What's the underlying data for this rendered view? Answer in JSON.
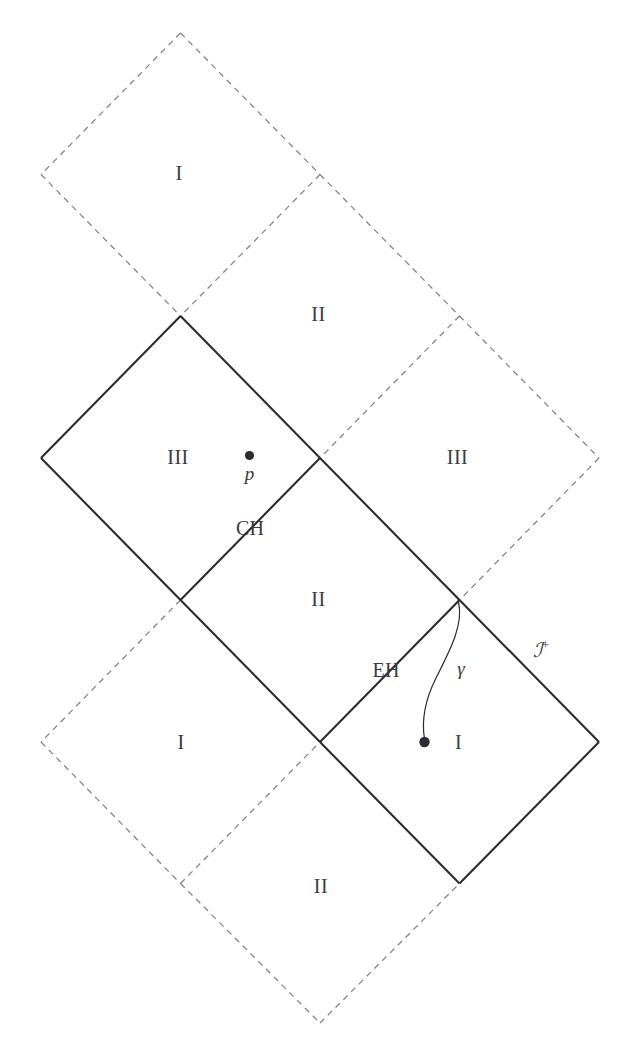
{
  "figure": {
    "kind": "penrose-conformal-diagram",
    "width": 635,
    "height": 1059,
    "background_color": "#ffffff",
    "solid_line_color": "#2b2b31",
    "dashed_line_color": "#85858c",
    "text_color": "#3a3a40",
    "solid_line_width": 2.1,
    "dashed_line_width": 1.3,
    "dash_pattern": "6 5"
  },
  "lattice": {
    "x_nodes": [
      41,
      180.5,
      320,
      459.5,
      599
    ],
    "y_nodes": [
      33,
      174.5,
      316,
      458,
      600,
      742,
      883.5,
      1023
    ],
    "x_spacing": 139.5,
    "y_spacing": 141.5
  },
  "edges": {
    "solid": [
      {
        "name": "ch-left-upper",
        "x1": 180.5,
        "y1": 316,
        "x2": 41,
        "y2": 458
      },
      {
        "name": "ch-right-upper",
        "x1": 180.5,
        "y1": 316,
        "x2": 320,
        "y2": 458
      },
      {
        "name": "iii-left-lower-left",
        "x1": 41,
        "y1": 458,
        "x2": 180.5,
        "y2": 600
      },
      {
        "name": "cauchy-horizon-CH",
        "x1": 320,
        "y1": 458,
        "x2": 180.5,
        "y2": 600
      },
      {
        "name": "ii-right-upper",
        "x1": 320,
        "y1": 458,
        "x2": 459.5,
        "y2": 600
      },
      {
        "name": "event-horizon-EH",
        "x1": 459.5,
        "y1": 600,
        "x2": 320,
        "y2": 742
      },
      {
        "name": "scri-plus-edge",
        "x1": 459.5,
        "y1": 600,
        "x2": 599,
        "y2": 742
      },
      {
        "name": "ii-lower-left",
        "x1": 180.5,
        "y1": 600,
        "x2": 320,
        "y2": 742
      },
      {
        "name": "region-i-lower-left",
        "x1": 320,
        "y1": 742,
        "x2": 459.5,
        "y2": 883.5
      },
      {
        "name": "region-i-lower-right",
        "x1": 599,
        "y1": 742,
        "x2": 459.5,
        "y2": 883.5
      }
    ],
    "dashed": [
      {
        "name": "top-i-upper-left",
        "x1": 180.5,
        "y1": 33,
        "x2": 41,
        "y2": 174.5
      },
      {
        "name": "top-i-upper-right",
        "x1": 180.5,
        "y1": 33,
        "x2": 320,
        "y2": 174.5
      },
      {
        "name": "top-i-lower-left",
        "x1": 41,
        "y1": 174.5,
        "x2": 180.5,
        "y2": 316
      },
      {
        "name": "top-i-lower-right",
        "x1": 320,
        "y1": 174.5,
        "x2": 180.5,
        "y2": 316
      },
      {
        "name": "top-ii-upper-right",
        "x1": 320,
        "y1": 174.5,
        "x2": 459.5,
        "y2": 316
      },
      {
        "name": "top-ii-lower-right",
        "x1": 459.5,
        "y1": 316,
        "x2": 320,
        "y2": 458
      },
      {
        "name": "right-iii-upper-right",
        "x1": 459.5,
        "y1": 316,
        "x2": 599,
        "y2": 458
      },
      {
        "name": "right-iii-lower-right",
        "x1": 599,
        "y1": 458,
        "x2": 459.5,
        "y2": 600
      },
      {
        "name": "left-i-upper-left",
        "x1": 180.5,
        "y1": 600,
        "x2": 41,
        "y2": 742
      },
      {
        "name": "left-i-lower-left",
        "x1": 41,
        "y1": 742,
        "x2": 180.5,
        "y2": 883.5
      },
      {
        "name": "left-i-lower-right",
        "x1": 180.5,
        "y1": 883.5,
        "x2": 320,
        "y2": 742
      },
      {
        "name": "bottom-ii-lower-left",
        "x1": 180.5,
        "y1": 883.5,
        "x2": 320,
        "y2": 1023
      },
      {
        "name": "bottom-ii-lower-right",
        "x1": 320,
        "y1": 1023,
        "x2": 459.5,
        "y2": 883.5
      }
    ]
  },
  "geodesic": {
    "name": "gamma",
    "label": "γ",
    "label_x": 461,
    "label_y": 668,
    "path": "M 458.5 602 C 464 625, 449 652, 436 678 C 426 698, 421 718, 424.5 739",
    "endpoint": {
      "x": 424.5,
      "y": 742,
      "r": 5.2
    }
  },
  "points": [
    {
      "name": "point-p",
      "label": "p",
      "dot_x": 249.5,
      "dot_y": 455.5,
      "r": 4.6,
      "label_x": 249.5,
      "label_y": 473
    },
    {
      "name": "gamma-endpoint",
      "label": "",
      "dot_x": 424.5,
      "dot_y": 742,
      "r": 5.2,
      "label_x": 0,
      "label_y": 0
    }
  ],
  "region_labels": [
    {
      "name": "region-I-top",
      "text": "I",
      "x": 179,
      "y": 173
    },
    {
      "name": "region-II-upper",
      "text": "II",
      "x": 318.5,
      "y": 314
    },
    {
      "name": "region-III-left",
      "text": "III",
      "x": 178,
      "y": 457
    },
    {
      "name": "region-III-right",
      "text": "III",
      "x": 457.5,
      "y": 457
    },
    {
      "name": "region-II-middle",
      "text": "II",
      "x": 318.5,
      "y": 599
    },
    {
      "name": "region-I-left-lower",
      "text": "I",
      "x": 181,
      "y": 742
    },
    {
      "name": "region-I-right-lower",
      "text": "I",
      "x": 458.5,
      "y": 742
    },
    {
      "name": "region-II-bottom",
      "text": "II",
      "x": 321,
      "y": 886
    }
  ],
  "horizon_labels": [
    {
      "name": "cauchy-horizon-label",
      "text": "CH",
      "x": 250,
      "y": 528
    },
    {
      "name": "event-horizon-label",
      "text": "EH",
      "x": 386,
      "y": 670
    }
  ],
  "boundary_labels": [
    {
      "name": "scri-plus-label",
      "base": "ℐ",
      "sup": "+",
      "x": 541,
      "y": 650
    }
  ],
  "legend": {
    "solid_meaning": "horizons and conformal boundary of the depicted blocks",
    "dashed_meaning": "continuation of the maximally extended spacetime"
  }
}
